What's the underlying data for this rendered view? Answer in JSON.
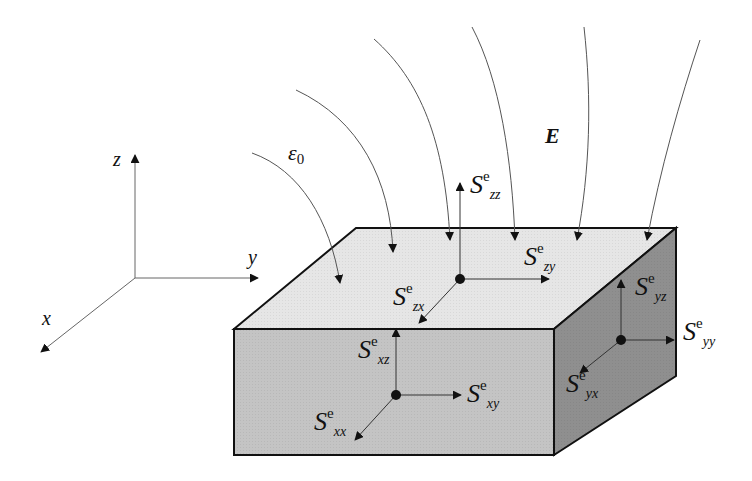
{
  "diagram": {
    "axes": {
      "z_label": "z",
      "y_label": "y",
      "x_label": "x"
    },
    "field": {
      "medium_label": "ε",
      "medium_sub": "0",
      "field_label": "E"
    },
    "top_face": {
      "normal_label": {
        "base": "S",
        "sup": "e",
        "sub": "zz"
      },
      "tangent_y_label": {
        "base": "S",
        "sup": "e",
        "sub": "zy"
      },
      "tangent_x_label": {
        "base": "S",
        "sup": "e",
        "sub": "zx"
      }
    },
    "front_face": {
      "normal_label": {
        "base": "S",
        "sup": "e",
        "sub": "xx"
      },
      "tangent_y_label": {
        "base": "S",
        "sup": "e",
        "sub": "xy"
      },
      "tangent_z_label": {
        "base": "S",
        "sup": "e",
        "sub": "xz"
      }
    },
    "side_face": {
      "normal_label": {
        "base": "S",
        "sup": "e",
        "sub": "yy"
      },
      "tangent_z_label": {
        "base": "S",
        "sup": "e",
        "sub": "yz"
      },
      "tangent_x_label": {
        "base": "S",
        "sup": "e",
        "sub": "yx"
      }
    },
    "colors": {
      "top_face": "#e6e6e6",
      "front_face": "#c4c4c4",
      "side_face": "#8f8f8f",
      "lines": "#111111",
      "field_lines": "#555555"
    }
  }
}
